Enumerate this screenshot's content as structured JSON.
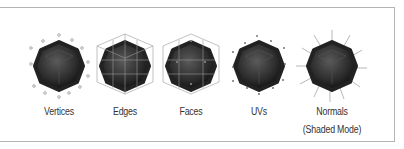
{
  "items": [
    {
      "id": "vertices",
      "label": "Vertices",
      "sub": ""
    },
    {
      "id": "edges",
      "label": "Edges",
      "sub": ""
    },
    {
      "id": "faces",
      "label": "Faces",
      "sub": ""
    },
    {
      "id": "uvs",
      "label": "UVs",
      "sub": ""
    },
    {
      "id": "normals",
      "label": "Normals",
      "sub": "(Shaded Mode)"
    }
  ],
  "colors": {
    "sphere_dark": "#1a1a1a",
    "sphere_light": "#5a5a5a",
    "border": "#b5b5b5",
    "cage": "#999999"
  }
}
